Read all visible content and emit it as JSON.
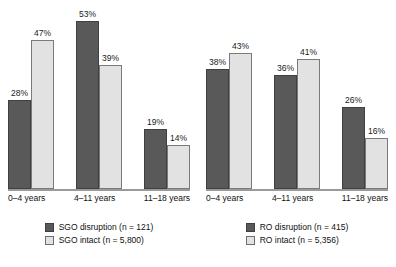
{
  "chart_data": [
    {
      "type": "bar",
      "title": "",
      "xlabel": "",
      "ylabel": "",
      "ylim": [
        0,
        55
      ],
      "grid": false,
      "legend_position": "bottom",
      "categories": [
        "0–4 years",
        "4–11 years",
        "11–18 years"
      ],
      "series": [
        {
          "name": "SGO disruption (n = 121)",
          "color": "#595959",
          "values": [
            28,
            53,
            19
          ],
          "labels": [
            "28%",
            "53%",
            "19%"
          ]
        },
        {
          "name": "SGO intact (n = 5,800)",
          "color": "#e2e2e2",
          "values": [
            47,
            39,
            14
          ],
          "labels": [
            "47%",
            "39%",
            "14%"
          ]
        }
      ]
    },
    {
      "type": "bar",
      "title": "",
      "xlabel": "",
      "ylabel": "",
      "ylim": [
        0,
        55
      ],
      "grid": false,
      "legend_position": "bottom",
      "categories": [
        "0–4 years",
        "4–11 years",
        "11–18 years"
      ],
      "series": [
        {
          "name": "RO disruption (n = 415)",
          "color": "#595959",
          "values": [
            38,
            36,
            26
          ],
          "labels": [
            "38%",
            "36%",
            "26%"
          ]
        },
        {
          "name": "RO intact (n = 5,356)",
          "color": "#e2e2e2",
          "values": [
            43,
            41,
            16
          ],
          "labels": [
            "43%",
            "41%",
            "16%"
          ]
        }
      ]
    }
  ],
  "panels": [
    {
      "id": "sgo",
      "xticks": [
        "0–4 years",
        "4–11 years",
        "11–18 years"
      ],
      "bars": [
        {
          "label": "28%",
          "value": 28,
          "style": "dark"
        },
        {
          "label": "47%",
          "value": 47,
          "style": "light"
        },
        {
          "label": "53%",
          "value": 53,
          "style": "dark"
        },
        {
          "label": "39%",
          "value": 39,
          "style": "light"
        },
        {
          "label": "19%",
          "value": 19,
          "style": "dark"
        },
        {
          "label": "14%",
          "value": 14,
          "style": "light"
        }
      ],
      "legend": [
        {
          "style": "dark",
          "text": "SGO disruption (n = 121)"
        },
        {
          "style": "light",
          "text": "SGO intact (n = 5,800)"
        }
      ]
    },
    {
      "id": "ro",
      "xticks": [
        "0–4 years",
        "4–11 years",
        "11–18 years"
      ],
      "bars": [
        {
          "label": "38%",
          "value": 38,
          "style": "dark"
        },
        {
          "label": "43%",
          "value": 43,
          "style": "light"
        },
        {
          "label": "36%",
          "value": 36,
          "style": "dark"
        },
        {
          "label": "41%",
          "value": 41,
          "style": "light"
        },
        {
          "label": "26%",
          "value": 26,
          "style": "dark"
        },
        {
          "label": "16%",
          "value": 16,
          "style": "light"
        }
      ],
      "legend": [
        {
          "style": "dark",
          "text": "RO disruption (n = 415)"
        },
        {
          "style": "light",
          "text": "RO intact (n = 5,356)"
        }
      ]
    }
  ],
  "colors": {
    "disruption": "#595959",
    "intact": "#e2e2e2",
    "axis": "#9a9a9a",
    "text": "#111111",
    "background": "#ffffff"
  },
  "scale": {
    "px_per_percent": 3.17,
    "max_percent": 55
  }
}
